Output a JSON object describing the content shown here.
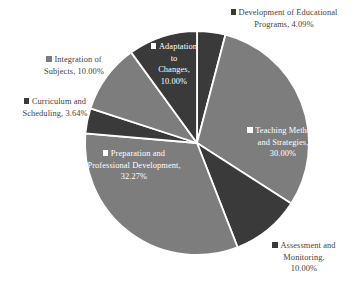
{
  "chart_data": {
    "type": "pie",
    "title": "",
    "subtitle": "",
    "xlabel": "",
    "ylabel": "",
    "legend_position": "data-labels-outside-and-inside",
    "grid": false,
    "start_angle_deg": 0,
    "direction": "clockwise",
    "categories": [
      "Development of Educational Programs",
      "Teaching Methods and Strategies",
      "Assessment and Monitoring",
      "Preparation and Professional Development",
      "Curriculum and Scheduling",
      "Integration of Subjects",
      "Adaptation to Changes"
    ],
    "values": [
      4.09,
      30.0,
      10.0,
      32.27,
      3.64,
      10.0,
      10.0
    ],
    "value_unit": "%",
    "slice_colors": [
      "#3a3a3a",
      "#7d7d7d",
      "#3a3a3a",
      "#7d7d7d",
      "#3a3a3a",
      "#7d7d7d",
      "#3a3a3a"
    ],
    "slices": [
      {
        "label": "Development of Educational Programs",
        "value": 4.09,
        "color": "#3a3a3a",
        "label_lines": [
          "Development of Educational",
          "Programs, 4.09%"
        ],
        "label_placement": "outside"
      },
      {
        "label": "Teaching Methods and Strategies",
        "value": 30.0,
        "color": "#7d7d7d",
        "label_lines": [
          "Teaching Methods",
          "and Strategies,",
          "30.00%"
        ],
        "label_placement": "inside"
      },
      {
        "label": "Assessment and Monitoring",
        "value": 10.0,
        "color": "#3a3a3a",
        "label_lines": [
          "Assessment and",
          "Monitoring,",
          "10.00%"
        ],
        "label_placement": "outside"
      },
      {
        "label": "Preparation and Professional Development",
        "value": 32.27,
        "color": "#7d7d7d",
        "label_lines": [
          "Preparation and",
          "Professional Development,",
          "32.27%"
        ],
        "label_placement": "inside"
      },
      {
        "label": "Curriculum and Scheduling",
        "value": 3.64,
        "color": "#3a3a3a",
        "label_lines": [
          "Curriculum and",
          "Scheduling, 3.64%"
        ],
        "label_placement": "outside"
      },
      {
        "label": "Integration of Subjects",
        "value": 10.0,
        "color": "#7d7d7d",
        "label_lines": [
          "Integration of",
          "Subjects, 10.00%"
        ],
        "label_placement": "outside"
      },
      {
        "label": "Adaptation to Changes",
        "value": 10.0,
        "color": "#3a3a3a",
        "label_lines": [
          "Adaptation",
          "to",
          "Changes,",
          "10.00%"
        ],
        "label_placement": "inside"
      }
    ]
  },
  "labels": {
    "programs": "Development of Educational Programs, 4.09%",
    "programs_line1": "Development of Educational",
    "programs_line2": "Programs, 4.09%",
    "teaching_line1": "Teaching Methods",
    "teaching_line2": "and Strategies,",
    "teaching_line3": "30.00%",
    "assessment_line1": "Assessment and",
    "assessment_line2": "Monitoring,",
    "assessment_line3": "10.00%",
    "preparation_line1": "Preparation and",
    "preparation_line2": "Professional Development,",
    "preparation_line3": "32.27%",
    "curriculum_line1": "Curriculum and",
    "curriculum_line2": "Scheduling, 3.64%",
    "integration_line1": "Integration of",
    "integration_line2": "Subjects, 10.00%",
    "adaptation_line1": "Adaptation",
    "adaptation_line2": "to",
    "adaptation_line3": "Changes,",
    "adaptation_line4": "10.00%"
  },
  "colors": {
    "dark_slice": "#3a3a3a",
    "light_slice": "#7d7d7d",
    "separator": "#ffffff",
    "background": "#ffffff",
    "outside_label_text": "#3f3f3f",
    "inside_label_text": "#ffffff"
  },
  "geometry": {
    "center_x": 197,
    "center_y": 143,
    "radius": 112
  }
}
